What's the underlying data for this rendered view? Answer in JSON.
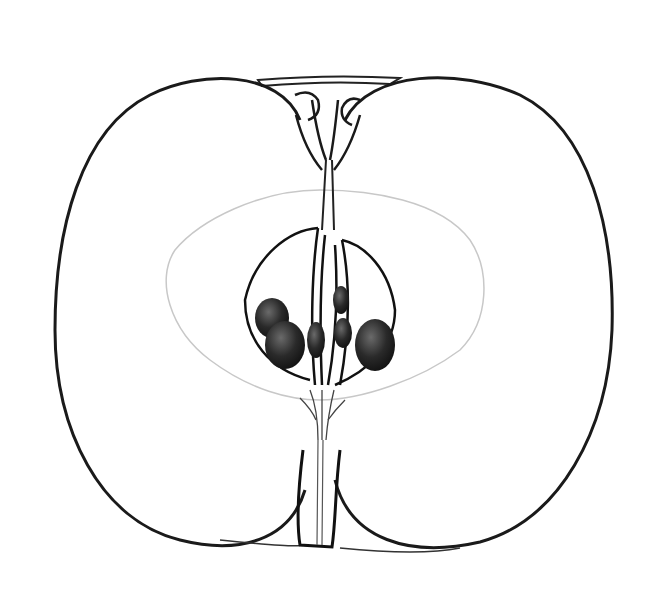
{
  "image": {
    "subject": "apple longitudinal cross-section illustration",
    "style": "black ink line drawing on white",
    "colors": {
      "background": "#ffffff",
      "ink": "#1a1a1a",
      "seed": "#222222",
      "faint": "#c8c8c8"
    },
    "parts": [
      "flesh-halves",
      "calyx",
      "core-line",
      "seed-chambers",
      "seeds",
      "stem"
    ],
    "seed_count": 6
  }
}
